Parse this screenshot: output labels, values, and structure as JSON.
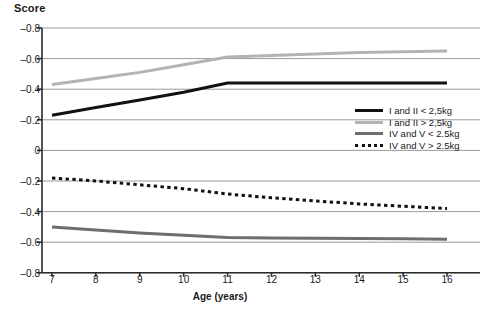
{
  "chart_data": {
    "type": "line",
    "title": "",
    "ylabel": "Score",
    "xlabel": "Age (years)",
    "x": [
      7,
      8,
      9,
      10,
      11,
      12,
      13,
      14,
      15,
      16
    ],
    "xlim": [
      7,
      16
    ],
    "x_ticklabels": [
      "7",
      "8",
      "9",
      "10",
      "11",
      "12",
      "13",
      "14",
      "15",
      "16"
    ],
    "y_ticklabels": [
      "-0.8",
      "-0.6",
      "-0.4",
      "-0.2",
      "0",
      "-0.2",
      "-0.4",
      "-0.6",
      "-0.8"
    ],
    "y_tickvalues": [
      -0.8,
      -0.6,
      -0.4,
      -0.2,
      0,
      -0.2,
      -0.4,
      -0.6,
      -0.8
    ],
    "axis_note": "mirrored axis: upper half runs 0 to -0.8 upward, lower half runs 0 to -0.8 downward",
    "grid": true,
    "legend_position": "center-right",
    "series": [
      {
        "name": "I and II < 2,5kg",
        "panel": "upper",
        "color": "#111111",
        "style": "solid",
        "width": 3,
        "values": [
          -0.23,
          -0.28,
          -0.33,
          -0.38,
          -0.44,
          -0.44,
          -0.44,
          -0.44,
          -0.44,
          -0.44
        ]
      },
      {
        "name": "I and II > 2,5kg",
        "panel": "upper",
        "color": "#b3b3b3",
        "style": "solid",
        "width": 3,
        "values": [
          -0.43,
          -0.47,
          -0.51,
          -0.56,
          -0.61,
          -0.62,
          -0.63,
          -0.64,
          -0.645,
          -0.65
        ]
      },
      {
        "name": "IV and V < 2.5kg",
        "panel": "lower",
        "color": "#6e6e6e",
        "style": "solid",
        "width": 3,
        "values": [
          -0.5,
          -0.52,
          -0.54,
          -0.555,
          -0.57,
          -0.572,
          -0.574,
          -0.576,
          -0.578,
          -0.58
        ]
      },
      {
        "name": "IV and V > 2.5kg",
        "panel": "lower",
        "color": "#111111",
        "style": "dotted",
        "width": 3,
        "values": [
          -0.18,
          -0.2,
          -0.225,
          -0.25,
          -0.285,
          -0.31,
          -0.33,
          -0.35,
          -0.365,
          -0.38
        ]
      }
    ]
  },
  "legend": {
    "items": [
      {
        "label": "I and II < 2,5kg",
        "color": "#111111",
        "style": "solid"
      },
      {
        "label": "I and II > 2,5kg",
        "color": "#b3b3b3",
        "style": "solid"
      },
      {
        "label": "IV and V < 2.5kg",
        "color": "#6e6e6e",
        "style": "solid"
      },
      {
        "label": "IV and V > 2.5kg",
        "color": "#111111",
        "style": "dotted"
      }
    ]
  }
}
